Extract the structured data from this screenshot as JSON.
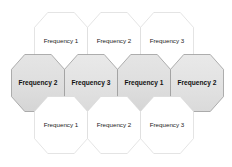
{
  "diagram": {
    "colors": {
      "background": "#ffffff",
      "outer_fill": "#ffffff",
      "outer_stroke": "#d8d8d8",
      "middle_fill": "#e4e4e4",
      "middle_fill_alt": "#dcdcdc",
      "middle_stroke": "#9a9a9a",
      "text": "#1a1a1a"
    },
    "geometry": {
      "hex_width": 53,
      "hex_height": 57,
      "rows": 3
    },
    "rows": [
      {
        "name": "top-row",
        "shaded": false,
        "cells": [
          {
            "label": "Frequency 1",
            "cx": 61,
            "cy": 41
          },
          {
            "label": "Frequency 2",
            "cx": 114,
            "cy": 41
          },
          {
            "label": "Frequency 3",
            "cx": 167,
            "cy": 41
          }
        ]
      },
      {
        "name": "middle-row",
        "shaded": true,
        "cells": [
          {
            "label": "Frequency 2",
            "cx": 38,
            "cy": 83
          },
          {
            "label": "Frequency 3",
            "cx": 91,
            "cy": 83
          },
          {
            "label": "Frequency 1",
            "cx": 144,
            "cy": 83
          },
          {
            "label": "Frequency 2",
            "cx": 197,
            "cy": 83
          }
        ]
      },
      {
        "name": "bottom-row",
        "shaded": false,
        "cells": [
          {
            "label": "Frequency 1",
            "cx": 61,
            "cy": 125
          },
          {
            "label": "Frequency 2",
            "cx": 114,
            "cy": 125
          },
          {
            "label": "Frequency 3",
            "cx": 167,
            "cy": 125
          }
        ]
      }
    ]
  }
}
